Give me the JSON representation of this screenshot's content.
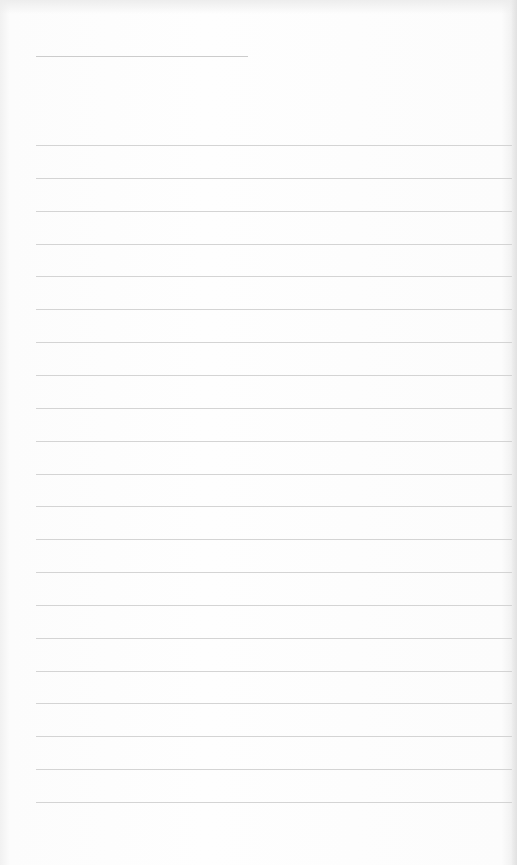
{
  "page": {
    "type": "lined-paper",
    "background_color": "#fbfbfb",
    "rule_color": "#cfcfcf",
    "header_rule": {
      "x": 36,
      "y": 56,
      "width": 212
    },
    "rules": {
      "x": 36,
      "width": 476,
      "start_y": 145,
      "spacing": 32.85,
      "count": 21
    }
  }
}
